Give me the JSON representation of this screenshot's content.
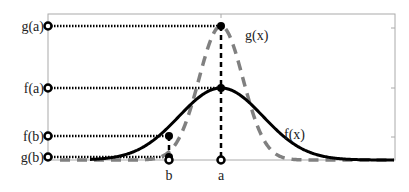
{
  "figure": {
    "curves": [
      {
        "name": "f(x)",
        "label": "f(x)",
        "style": "solid",
        "color": "#000000"
      },
      {
        "name": "g(x)",
        "label": "g(x)",
        "style": "dashed",
        "color": "#808080"
      }
    ],
    "x_labels": {
      "a": "a",
      "b": "b"
    },
    "y_labels": {
      "g_a": "g(a)",
      "f_a": "f(a)",
      "f_b": "f(b)",
      "g_b": "g(b)"
    },
    "colors": {
      "axes": "#999999",
      "guide": "#000000"
    }
  }
}
